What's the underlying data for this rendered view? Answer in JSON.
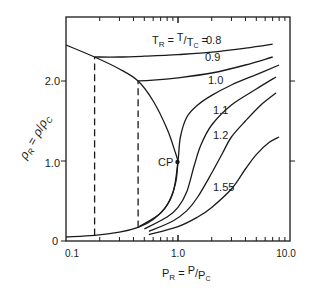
{
  "chart_data": {
    "type": "line",
    "title": "",
    "xlabel": "P_R = P/P_C",
    "ylabel": "ρ_R = ρ/ρ_C",
    "x_scale": "log",
    "xlim": [
      0.1,
      10.0
    ],
    "ylim": [
      0,
      2.8
    ],
    "x_tick_labels": [
      "0.1",
      "1.0",
      "10.0"
    ],
    "y_tick_labels": [
      "0",
      "1.0",
      "2.0"
    ],
    "legend_header": "T_R = T/T_C =",
    "annotations": [
      {
        "text": "CP",
        "x": 1.0,
        "y": 1.0
      }
    ],
    "grid": false,
    "series": [
      {
        "name": "0.8",
        "label": "0.8",
        "style": "solid",
        "x": [
          0.18,
          0.3,
          0.5,
          1.0,
          2.0,
          4.0,
          7.0
        ],
        "y": [
          2.3,
          2.3,
          2.31,
          2.33,
          2.36,
          2.41,
          2.46
        ]
      },
      {
        "name": "0.9",
        "label": "0.9",
        "style": "solid",
        "x": [
          0.44,
          0.6,
          1.0,
          2.0,
          4.0,
          7.0
        ],
        "y": [
          2.0,
          2.01,
          2.04,
          2.1,
          2.2,
          2.3
        ]
      },
      {
        "name": "1.0",
        "label": "1.0",
        "style": "solid",
        "x": [
          0.45,
          0.7,
          0.9,
          1.0,
          1.05,
          1.2,
          1.5,
          2.0,
          3.0,
          5.0,
          8.0
        ],
        "y": [
          0.18,
          0.35,
          0.6,
          1.0,
          1.3,
          1.55,
          1.7,
          1.82,
          1.95,
          2.08,
          2.2
        ]
      },
      {
        "name": "1.1",
        "label": "1.1",
        "style": "solid",
        "x": [
          0.5,
          0.8,
          1.0,
          1.2,
          1.4,
          1.6,
          2.0,
          3.0,
          5.0,
          7.5
        ],
        "y": [
          0.15,
          0.3,
          0.42,
          0.62,
          0.95,
          1.2,
          1.45,
          1.7,
          1.9,
          2.05
        ]
      },
      {
        "name": "1.2",
        "label": "1.2",
        "style": "solid",
        "x": [
          0.55,
          0.9,
          1.2,
          1.5,
          2.0,
          2.5,
          3.0,
          4.0,
          5.5,
          7.5
        ],
        "y": [
          0.12,
          0.25,
          0.38,
          0.55,
          0.85,
          1.1,
          1.3,
          1.5,
          1.7,
          1.85
        ]
      },
      {
        "name": "1.55",
        "label": "1.55",
        "style": "solid",
        "x": [
          0.55,
          1.0,
          1.5,
          2.0,
          3.0,
          4.0,
          5.0,
          6.5,
          8.0
        ],
        "y": [
          0.08,
          0.18,
          0.3,
          0.42,
          0.65,
          0.9,
          1.08,
          1.23,
          1.3
        ]
      },
      {
        "name": "saturation dome (liquid)",
        "label": "",
        "style": "solid",
        "x": [
          0.1,
          0.18,
          0.3,
          0.44,
          0.6,
          0.8,
          0.95,
          1.0
        ],
        "y": [
          2.45,
          2.3,
          2.15,
          2.0,
          1.75,
          1.4,
          1.1,
          1.0
        ]
      },
      {
        "name": "saturation dome (vapor)",
        "label": "",
        "style": "solid",
        "x": [
          0.1,
          0.18,
          0.3,
          0.44,
          0.6,
          0.8,
          0.95,
          1.0
        ],
        "y": [
          0.05,
          0.07,
          0.11,
          0.17,
          0.27,
          0.45,
          0.72,
          1.0
        ]
      },
      {
        "name": "0.8 two-phase tie line",
        "label": "",
        "style": "dashed",
        "x": [
          0.18,
          0.18
        ],
        "y": [
          0.07,
          2.3
        ]
      },
      {
        "name": "0.9 two-phase tie line",
        "label": "",
        "style": "dashed",
        "x": [
          0.44,
          0.44
        ],
        "y": [
          0.17,
          2.0
        ]
      }
    ]
  }
}
